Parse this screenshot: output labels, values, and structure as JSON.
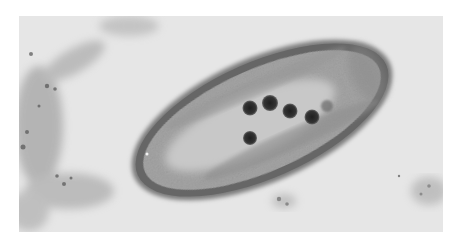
{
  "image": {
    "kind": "transmission electron micrograph",
    "subject": "elongated bacterial cell in cross-section with dark spherical inclusions",
    "colors": {
      "page_background": "#ffffff",
      "field_background": "#e6e6e6",
      "cell_wall": "#5e5e5e",
      "cell_cytoplasm": "#a8a8a8",
      "cell_inner_light": "#cfcfcf",
      "inclusion": "#2e2e2e",
      "debris": "#8a8a8a"
    },
    "inclusions_count": 6
  }
}
